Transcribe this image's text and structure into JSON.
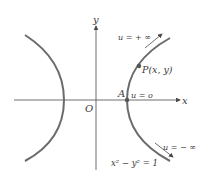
{
  "diagram": {
    "type": "hyperbola",
    "equation": "x² − y² = 1",
    "axes": {
      "x_label": "x",
      "y_label": "y",
      "origin_label": "O"
    },
    "points": [
      {
        "id": "A",
        "label": "A",
        "annotation": "u = o"
      },
      {
        "id": "P",
        "label": "P(x, y)"
      }
    ],
    "annotations": {
      "upper": "u = + ∞",
      "lower": "u = − ∞"
    },
    "colors": {
      "curve": "#6b6b6b",
      "axis": "#4a4a4a",
      "text": "#3a3a3a"
    }
  }
}
